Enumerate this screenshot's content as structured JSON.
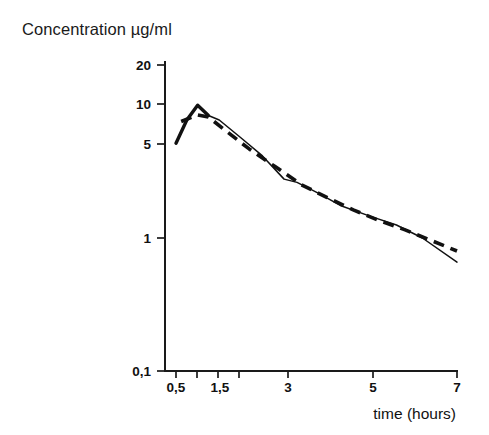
{
  "chart_data": {
    "type": "line",
    "title": "Concentration µg/ml",
    "xlabel": "time (hours)",
    "ylabel": "Concentration µg/ml",
    "yscale": "log",
    "xscale": "linear",
    "grid": false,
    "legend": "none",
    "xlim": [
      0.2,
      7
    ],
    "ylim": [
      0.1,
      25
    ],
    "xticks": [
      0.5,
      1,
      1.5,
      2,
      3,
      5,
      7
    ],
    "xticklabels": [
      "0,5",
      "",
      "1,5",
      "",
      "3",
      "5",
      "7"
    ],
    "yticks": [
      20,
      10,
      5,
      1,
      0.1
    ],
    "yticklabels": [
      "20",
      "10",
      "5",
      "1",
      "0,1"
    ],
    "series": [
      {
        "name": "solid-curve",
        "style": "solid",
        "x": [
          0.5,
          0.75,
          1.0,
          1.25,
          1.5,
          2.0,
          2.5,
          3.0,
          3.3,
          3.8,
          4.3,
          5.0,
          5.6,
          6.2,
          7.0
        ],
        "y": [
          5.1,
          7.6,
          9.8,
          8.2,
          7.6,
          5.6,
          4.1,
          2.75,
          2.6,
          2.15,
          1.75,
          1.45,
          1.25,
          1.0,
          0.66
        ]
      },
      {
        "name": "dashed-curve",
        "style": "dashed",
        "x": [
          0.62,
          1.0,
          1.25,
          1.6,
          2.2,
          2.8,
          3.4,
          4.0,
          4.6,
          5.2,
          5.8,
          6.4,
          7.0
        ],
        "y": [
          7.4,
          8.3,
          8.0,
          6.5,
          4.6,
          3.4,
          2.5,
          2.0,
          1.62,
          1.35,
          1.15,
          0.96,
          0.8
        ]
      }
    ]
  },
  "axes": {
    "y_axis_name": "concentration-axis",
    "x_axis_name": "time-axis"
  }
}
